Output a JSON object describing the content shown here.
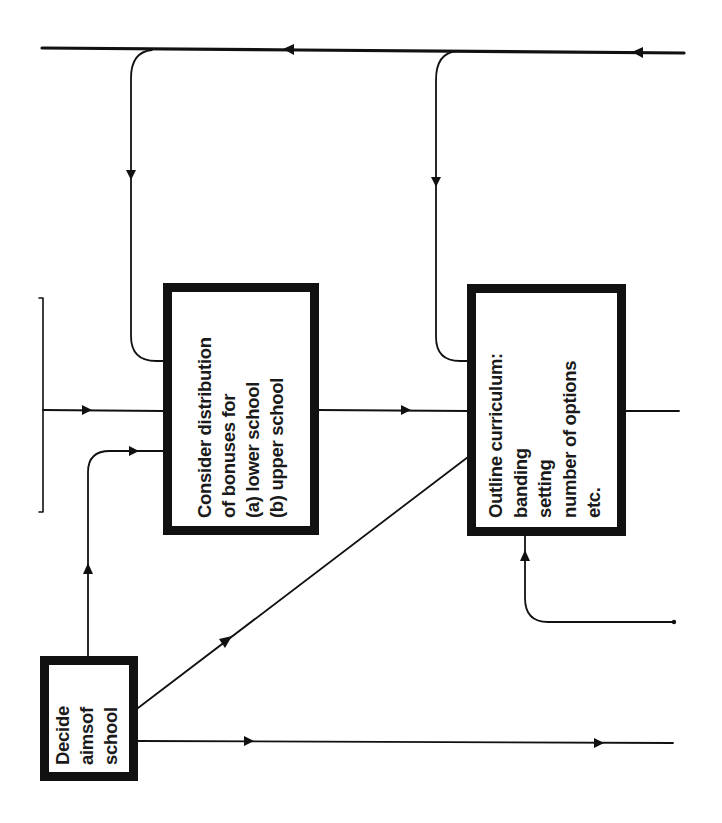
{
  "diagram": {
    "type": "flowchart",
    "orientation": "rotated -90deg (text reads bottom-to-top)",
    "colors": {
      "ink": "#111111",
      "background": "#ffffff"
    },
    "boxes": [
      {
        "id": "aims",
        "lines": [
          "Decide",
          "aimsof",
          "school"
        ]
      },
      {
        "id": "bonuses",
        "lines": [
          "Consider distribution",
          "of bonuses for",
          "(a) lower school",
          "(b) upper school"
        ]
      },
      {
        "id": "curriculum",
        "lines": [
          "Outline curriculum:",
          "banding",
          "setting",
          "number of options",
          "etc."
        ]
      }
    ],
    "connectors": [
      {
        "from": "right-edge",
        "to": "top-feedback-line",
        "direction": "leftward"
      },
      {
        "from": "top-feedback-line",
        "to": "bonuses",
        "direction": "down"
      },
      {
        "from": "top-feedback-line",
        "to": "curriculum",
        "direction": "down"
      },
      {
        "from": "left-bracket",
        "to": "bonuses",
        "direction": "right"
      },
      {
        "from": "aims",
        "to": "bonuses",
        "direction": "up-then-right"
      },
      {
        "from": "bonuses",
        "to": "curriculum",
        "direction": "right"
      },
      {
        "from": "aims",
        "to": "curriculum",
        "direction": "diagonal"
      },
      {
        "from": "right-edge",
        "to": "curriculum",
        "direction": "left-then-up"
      },
      {
        "from": "curriculum",
        "to": "right-edge",
        "direction": "right"
      },
      {
        "from": "aims",
        "to": "right-edge",
        "direction": "right"
      }
    ]
  }
}
